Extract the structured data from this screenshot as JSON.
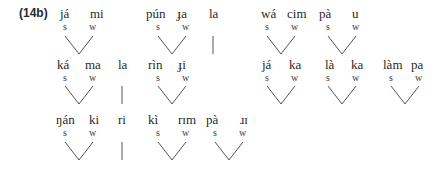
{
  "example_label": "(14b)",
  "strong_label": "s",
  "weak_label": "w",
  "feet": [
    {
      "type": "binary",
      "s": "já",
      "w": "mi",
      "sx": 60,
      "wx": 90,
      "row": 0,
      "apex": 79
    },
    {
      "type": "binary",
      "s": "pún",
      "w": "ɟa",
      "sx": 146,
      "wx": 177,
      "row": 0,
      "apex": 172
    },
    {
      "type": "unary",
      "s": "la",
      "sx": 209,
      "row": 0,
      "apex": 213
    },
    {
      "type": "binary",
      "s": "wá",
      "w": "cim",
      "sx": 261,
      "wx": 287,
      "row": 0,
      "apex": 281
    },
    {
      "type": "binary",
      "s": "pà",
      "w": "u",
      "sx": 319,
      "wx": 352,
      "row": 0,
      "apex": 342
    },
    {
      "type": "binary",
      "s": "ká",
      "w": "ma",
      "sx": 57,
      "wx": 85,
      "row": 1,
      "apex": 79
    },
    {
      "type": "unary",
      "s": "la",
      "sx": 118,
      "row": 1,
      "apex": 122
    },
    {
      "type": "binary",
      "s": "rìn",
      "w": "ɟi",
      "sx": 148,
      "wx": 178,
      "row": 1,
      "apex": 172
    },
    {
      "type": "binary",
      "s": "já",
      "w": "ka",
      "sx": 262,
      "wx": 289,
      "row": 1,
      "apex": 281
    },
    {
      "type": "binary",
      "s": "là",
      "w": "ka",
      "sx": 325,
      "wx": 351,
      "row": 1,
      "apex": 342
    },
    {
      "type": "binary",
      "s": "làm",
      "w": "pa",
      "sx": 383,
      "wx": 411,
      "row": 1,
      "apex": 405
    },
    {
      "type": "binary",
      "s": "ŋán",
      "w": "ki",
      "sx": 56,
      "wx": 89,
      "row": 2,
      "apex": 79
    },
    {
      "type": "unary",
      "s": "ri",
      "sx": 118,
      "row": 2,
      "apex": 122
    },
    {
      "type": "binary",
      "s": "kì",
      "w": "rɪm",
      "sx": 148,
      "wx": 178,
      "row": 2,
      "apex": 172
    },
    {
      "type": "binary",
      "s": "pà",
      "w": "ɹɪ",
      "sx": 206,
      "wx": 240,
      "row": 2,
      "apex": 229
    }
  ]
}
